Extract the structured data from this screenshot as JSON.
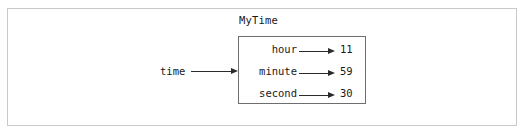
{
  "diagram": {
    "type": "object-state-diagram",
    "outer_frame": {
      "border_color": "#c9c9c9"
    },
    "reference": {
      "label": "time",
      "arrow": "arrow-right",
      "points_to": "MyTime"
    },
    "object": {
      "title": "MyTime",
      "border_color": "#6e6e6e",
      "attributes": [
        {
          "name": "hour",
          "arrow": "arrow-right",
          "value": "11"
        },
        {
          "name": "minute",
          "arrow": "arrow-right",
          "value": "59"
        },
        {
          "name": "second",
          "arrow": "arrow-right",
          "value": "30"
        }
      ]
    }
  }
}
